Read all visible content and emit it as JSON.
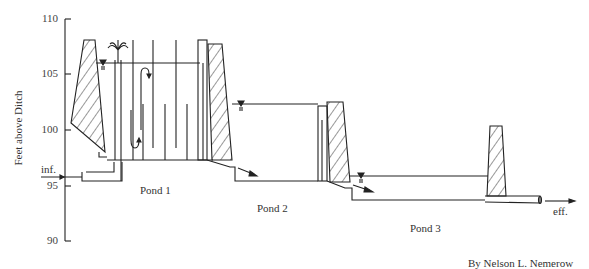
{
  "diagram": {
    "ylabel": "Feet above Ditch",
    "y_ticks": [
      {
        "label": "110",
        "value": 110,
        "y": 19
      },
      {
        "label": "105",
        "value": 105,
        "y": 74
      },
      {
        "label": "100",
        "value": 100,
        "y": 130
      },
      {
        "label": "95",
        "value": 95,
        "y": 186
      },
      {
        "label": "90",
        "value": 90,
        "y": 241
      }
    ],
    "labels": {
      "inflow": "inf.",
      "effluent": "eff.",
      "pond1": "Pond 1",
      "pond2": "Pond 2",
      "pond3": "Pond 3",
      "credit": "By Nelson L. Nemerow"
    },
    "ponds": [
      {
        "name": "Pond 1",
        "water_level_ft": 106,
        "bottom_ft": 97
      },
      {
        "name": "Pond 2",
        "water_level_ft": 99.5,
        "bottom_ft": 94.5
      },
      {
        "name": "Pond 3",
        "water_level_ft": 96.1,
        "bottom_ft": 93.5
      }
    ],
    "colors": {
      "line": "#222222",
      "background": "#ffffff"
    }
  }
}
